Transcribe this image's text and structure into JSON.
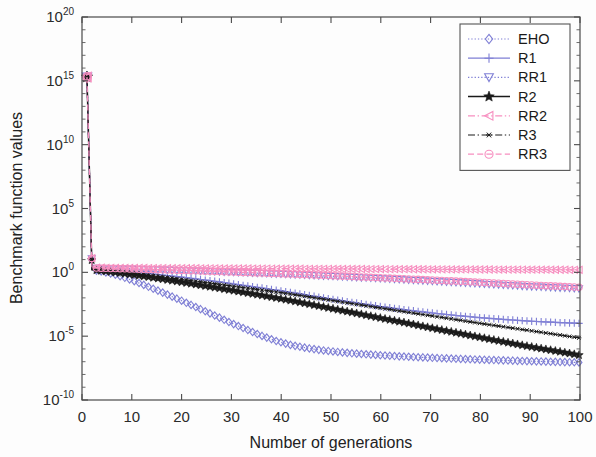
{
  "chart_data": {
    "type": "line",
    "title": "",
    "xlabel": "Number of generations",
    "ylabel": "Benchmark function values",
    "xlim": [
      0,
      100
    ],
    "ylim": [
      1e-10,
      1e+20
    ],
    "yscale": "log",
    "xticks": [
      0,
      10,
      20,
      30,
      40,
      50,
      60,
      70,
      80,
      90,
      100
    ],
    "xticklabels": [
      "0",
      "10",
      "20",
      "30",
      "40",
      "50",
      "60",
      "70",
      "80",
      "90",
      "100"
    ],
    "yticks": [
      1e+20,
      1000000000000000.0,
      10000000000.0,
      100000.0,
      1,
      1e-05,
      1e-10
    ],
    "yticklabels": [
      "10^20",
      "10^15",
      "10^10",
      "10^5",
      "10^0",
      "10^-5",
      "10^-10"
    ],
    "ytick_mantissa": "10",
    "ytick_exponents": [
      "20",
      "15",
      "10",
      "5",
      "0",
      "-5",
      "-10"
    ],
    "grid": false,
    "legend_position": "upper right",
    "series": [
      {
        "name": "EHO",
        "color": "#7f7fd5",
        "marker": "diamond",
        "linestyle": "dotted",
        "x": [
          1,
          2,
          3,
          4,
          5,
          6,
          7,
          8,
          9,
          10,
          12,
          14,
          16,
          18,
          20,
          22,
          24,
          26,
          28,
          30,
          33,
          36,
          39,
          42,
          45,
          48,
          51,
          54,
          57,
          60,
          64,
          68,
          72,
          76,
          80,
          84,
          88,
          92,
          96,
          100
        ],
        "y": [
          2000000000000000.0,
          1.6,
          1.35,
          1.15,
          0.95,
          0.78,
          0.6,
          0.45,
          0.33,
          0.24,
          0.12,
          0.058,
          0.028,
          0.013,
          0.006,
          0.0027,
          0.0012,
          0.00054,
          0.00024,
          0.000105,
          3.4e-05,
          1.1e-05,
          4.2e-06,
          2e-06,
          1.2e-06,
          8e-07,
          6e-07,
          4.6e-07,
          3.8e-07,
          3.2e-07,
          2.6e-07,
          2.2e-07,
          1.9e-07,
          1.65e-07,
          1.45e-07,
          1.3e-07,
          1.15e-07,
          1.05e-07,
          9.5e-08,
          8.8e-08
        ]
      },
      {
        "name": "R1",
        "color": "#7f7fd5",
        "marker": "plus",
        "linestyle": "solid",
        "x": [
          1,
          2,
          3,
          4,
          5,
          6,
          8,
          10,
          13,
          16,
          20,
          24,
          28,
          32,
          36,
          40,
          45,
          50,
          55,
          60,
          65,
          70,
          75,
          80,
          85,
          90,
          95,
          100
        ],
        "y": [
          2000000000000000.0,
          1.9,
          1.8,
          1.72,
          1.62,
          1.5,
          1.3,
          1.1,
          0.85,
          0.62,
          0.42,
          0.27,
          0.17,
          0.1,
          0.06,
          0.035,
          0.017,
          0.008,
          0.004,
          0.0021,
          0.00115,
          0.00068,
          0.00042,
          0.00028,
          0.0002,
          0.00015,
          0.00012,
          0.0001
        ]
      },
      {
        "name": "RR1",
        "color": "#7f7fd5",
        "marker": "triangle-down",
        "linestyle": "dotted",
        "x": [
          1,
          2,
          3,
          4,
          6,
          8,
          10,
          14,
          18,
          22,
          26,
          30,
          35,
          40,
          45,
          50,
          55,
          60,
          65,
          70,
          75,
          80,
          85,
          90,
          95,
          100
        ],
        "y": [
          2000000000000000.0,
          2.1,
          2.05,
          2.0,
          1.9,
          1.82,
          1.75,
          1.6,
          1.45,
          1.3,
          1.15,
          1.02,
          0.86,
          0.72,
          0.6,
          0.49,
          0.4,
          0.32,
          0.255,
          0.2,
          0.158,
          0.124,
          0.097,
          0.076,
          0.062,
          0.052
        ]
      },
      {
        "name": "R2",
        "color": "#1a1a1a",
        "marker": "star",
        "linestyle": "solid",
        "x": [
          1,
          2,
          3,
          4,
          5,
          6,
          8,
          10,
          13,
          16,
          20,
          24,
          28,
          32,
          36,
          40,
          45,
          50,
          55,
          60,
          65,
          70,
          75,
          80,
          85,
          90,
          95,
          100
        ],
        "y": [
          2000000000000000.0,
          1.6,
          1.45,
          1.3,
          1.18,
          1.05,
          0.85,
          0.66,
          0.45,
          0.3,
          0.17,
          0.095,
          0.053,
          0.029,
          0.016,
          0.0085,
          0.0036,
          0.0015,
          0.00063,
          0.00026,
          0.00011,
          4.5e-05,
          1.9e-05,
          8e-06,
          3.4e-06,
          1.5e-06,
          7e-07,
          3.2e-07
        ]
      },
      {
        "name": "RR2",
        "color": "#f78fc0",
        "marker": "triangle-left",
        "linestyle": "dashdot",
        "x": [
          1,
          2,
          3,
          4,
          6,
          8,
          12,
          16,
          20,
          26,
          32,
          38,
          44,
          50,
          56,
          62,
          68,
          74,
          80,
          86,
          92,
          96,
          100
        ],
        "y": [
          2000000000000000.0,
          2.3,
          2.3,
          2.28,
          2.25,
          2.22,
          2.18,
          2.14,
          2.1,
          2.05,
          2.0,
          1.95,
          1.9,
          1.86,
          1.82,
          1.78,
          1.74,
          1.7,
          1.67,
          1.64,
          1.61,
          1.59,
          1.57
        ]
      },
      {
        "name": "R3",
        "color": "#1a1a1a",
        "marker": "asterisk",
        "linestyle": "dashdot",
        "x": [
          1,
          2,
          3,
          4,
          5,
          6,
          8,
          10,
          13,
          16,
          20,
          24,
          28,
          32,
          36,
          40,
          45,
          50,
          55,
          60,
          65,
          70,
          75,
          80,
          85,
          90,
          95,
          100
        ],
        "y": [
          2000000000000000.0,
          1.7,
          1.55,
          1.42,
          1.3,
          1.2,
          1.0,
          0.82,
          0.6,
          0.44,
          0.28,
          0.175,
          0.11,
          0.068,
          0.042,
          0.026,
          0.013,
          0.0065,
          0.0032,
          0.0016,
          0.0008,
          0.0004,
          0.0002,
          0.0001,
          5.2e-05,
          2.7e-05,
          1.4e-05,
          7.2e-06
        ]
      },
      {
        "name": "RR3",
        "color": "#f78fc0",
        "marker": "circle",
        "linestyle": "dashed",
        "x": [
          1,
          2,
          3,
          4,
          6,
          8,
          12,
          16,
          20,
          26,
          32,
          38,
          44,
          50,
          56,
          62,
          68,
          74,
          80,
          86,
          92,
          96,
          100
        ],
        "y": [
          2000000000000000.0,
          2.2,
          2.15,
          2.1,
          2.0,
          1.92,
          1.75,
          1.58,
          1.42,
          1.2,
          1.0,
          0.83,
          0.68,
          0.55,
          0.44,
          0.35,
          0.275,
          0.215,
          0.165,
          0.125,
          0.095,
          0.08,
          0.068
        ]
      }
    ],
    "legend_entries": [
      {
        "label": "EHO",
        "color": "#7f7fd5",
        "marker": "diamond",
        "linestyle": "dotted"
      },
      {
        "label": "R1",
        "color": "#7f7fd5",
        "marker": "plus",
        "linestyle": "solid"
      },
      {
        "label": "RR1",
        "color": "#7f7fd5",
        "marker": "triangle-down",
        "linestyle": "dotted"
      },
      {
        "label": "R2",
        "color": "#1a1a1a",
        "marker": "star",
        "linestyle": "solid"
      },
      {
        "label": "RR2",
        "color": "#f78fc0",
        "marker": "triangle-left",
        "linestyle": "dashdot"
      },
      {
        "label": "R3",
        "color": "#1a1a1a",
        "marker": "asterisk",
        "linestyle": "dashdot"
      },
      {
        "label": "RR3",
        "color": "#f78fc0",
        "marker": "circle",
        "linestyle": "dashed"
      }
    ]
  },
  "figure": {
    "background_color": "#fdfdfd",
    "axis_color": "#4a4a4a",
    "plot_left": 82,
    "plot_right": 580,
    "plot_top": 17,
    "plot_bottom": 400
  }
}
